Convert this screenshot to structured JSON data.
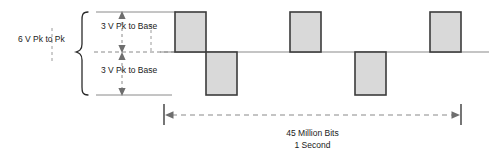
{
  "diagram": {
    "colors": {
      "pulse_fill": "#d9d9d9",
      "pulse_stroke": "#3b3b3b",
      "baseline": "#8a8a8a",
      "dashed": "#8a8a8a",
      "text": "#1a1a1a",
      "background": "#ffffff"
    },
    "annotations": {
      "peak_to_peak": "6 V Pk to Pk",
      "upper_amplitude": "3 V Pk to Base",
      "lower_amplitude": "3 V Pk to Base",
      "span_bits": "45 Million Bits",
      "span_time": "1 Second"
    },
    "axes": {
      "baseline_y": 52,
      "positive_peak_y": 12,
      "negative_peak_y": 95,
      "span_start_x": 164,
      "span_end_x": 461
    },
    "waveform": {
      "description": "Alternating positive and negative rectangular pulses about a zero baseline",
      "pulses": [
        {
          "index": 1,
          "polarity": "positive",
          "x": 175,
          "width": 31
        },
        {
          "index": 2,
          "polarity": "negative",
          "x": 206,
          "width": 31
        },
        {
          "index": 3,
          "polarity": "positive",
          "x": 290,
          "width": 31
        },
        {
          "index": 4,
          "polarity": "negative",
          "x": 355,
          "width": 31
        },
        {
          "index": 5,
          "polarity": "positive",
          "x": 430,
          "width": 31
        }
      ]
    }
  }
}
